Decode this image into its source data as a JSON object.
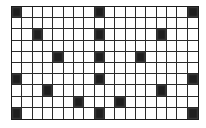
{
  "figure": {
    "type": "grid-pattern",
    "rows": 10,
    "cols": 18,
    "line_color": "#2a2a2a",
    "fill_color": "#1e1e1e",
    "empty_color": "#ffffff",
    "filled_cells": [
      [
        0,
        0
      ],
      [
        0,
        8
      ],
      [
        0,
        17
      ],
      [
        2,
        2
      ],
      [
        2,
        8
      ],
      [
        2,
        14
      ],
      [
        4,
        4
      ],
      [
        4,
        8
      ],
      [
        4,
        12
      ],
      [
        6,
        0
      ],
      [
        6,
        8
      ],
      [
        6,
        17
      ],
      [
        7,
        3
      ],
      [
        7,
        14
      ],
      [
        8,
        6
      ],
      [
        8,
        10
      ],
      [
        9,
        0
      ],
      [
        9,
        8
      ],
      [
        9,
        17
      ]
    ]
  }
}
